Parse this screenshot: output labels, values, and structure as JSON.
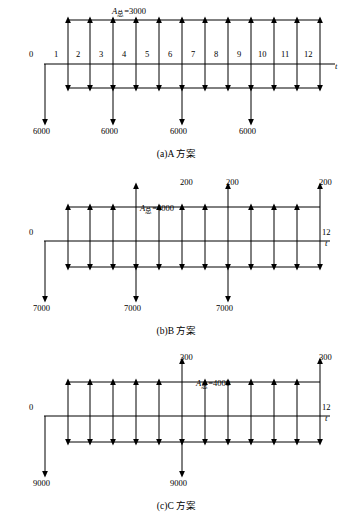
{
  "figure": {
    "title_absent": true,
    "panels": [
      {
        "id": "a",
        "caption": "(a)A 方案",
        "top_label": "A总=3000",
        "axis_label": "t",
        "tick_labels": [
          "0",
          "1",
          "2",
          "3",
          "4",
          "5",
          "6",
          "7",
          "8",
          "9",
          "10",
          "11",
          "12"
        ],
        "down_labels": [
          "6000",
          "6000",
          "6000",
          "6000"
        ],
        "up_value": "3000",
        "down_value": "6000",
        "n_up_arrows": 12,
        "n_down_arrows": 4,
        "down_positions": [
          0,
          3,
          6,
          9
        ]
      },
      {
        "id": "b",
        "caption": "(b)B 方案",
        "top_label": "A总=4000",
        "axis_label": "t",
        "tick_labels": [
          "0",
          "12"
        ],
        "up_small_labels": [
          "200",
          "200",
          "200"
        ],
        "down_labels": [
          "7000",
          "7000",
          "7000"
        ],
        "up_value": "4000",
        "small_up_value": "200",
        "down_value": "7000",
        "n_up_arrows": 12,
        "n_down_arrows": 3,
        "down_positions": [
          0,
          4,
          8
        ],
        "tall_up_positions": [
          3,
          7,
          11
        ]
      },
      {
        "id": "c",
        "caption": "(c)C 方案",
        "top_label": "A总=4000",
        "axis_label": "t",
        "tick_labels": [
          "0",
          "12"
        ],
        "up_small_labels": [
          "300",
          "300"
        ],
        "down_labels": [
          "9000",
          "9000"
        ],
        "up_value": "4000",
        "small_up_value": "300",
        "down_value": "9000",
        "n_up_arrows": 12,
        "n_down_arrows": 2,
        "down_positions": [
          0,
          6
        ],
        "tall_up_positions": [
          5,
          11
        ]
      }
    ],
    "colors": {
      "stroke": "#000000",
      "background": "#ffffff"
    }
  }
}
